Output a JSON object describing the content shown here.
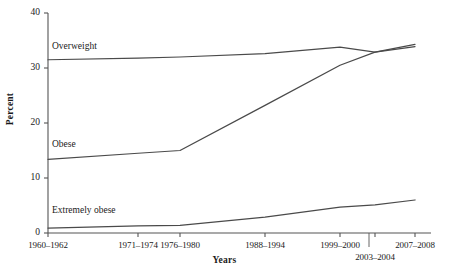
{
  "chart_data": {
    "type": "line",
    "title": "",
    "xlabel": "Years",
    "ylabel": "Percent",
    "ylim": [
      0,
      40
    ],
    "yticks": [
      0,
      10,
      20,
      30,
      40
    ],
    "ytick_labels": [
      "0",
      "10",
      "20",
      "30",
      "40"
    ],
    "grid": false,
    "legend_position": "inline-series-labels",
    "categories": [
      "1960–1962",
      "1971–1974",
      "1976–1980",
      "1988–1994",
      "1999–2000",
      "2003–2004",
      "2007–2008"
    ],
    "series": [
      {
        "name": "Overweight",
        "values": [
          31.5,
          31.8,
          32.0,
          32.6,
          33.8,
          32.9,
          34.3
        ],
        "color": "#4a4a4a"
      },
      {
        "name": "Obese",
        "values": [
          13.4,
          14.5,
          15.0,
          23.2,
          30.5,
          32.9,
          33.9
        ],
        "color": "#4a4a4a"
      },
      {
        "name": "Extremely obese",
        "values": [
          0.9,
          1.3,
          1.4,
          2.9,
          4.7,
          5.1,
          6.0
        ],
        "color": "#4a4a4a"
      }
    ],
    "annotations": [
      {
        "text": "Overweight",
        "series": "Overweight"
      },
      {
        "text": "Obese",
        "series": "Obese"
      },
      {
        "text": "Extremely obese",
        "series": "Extremely obese"
      }
    ],
    "axis_color": "#555555",
    "background_color": "#ffffff"
  },
  "axes": {
    "y_title": "Percent",
    "x_title": "Years",
    "y_ticks": [
      "40",
      "30",
      "20",
      "10",
      "0"
    ],
    "x_ticks_row1": [
      "1960–1962",
      "1971–1974",
      "1976–1980",
      "1988–1994",
      "1999–2000",
      "2007–2008"
    ],
    "x_ticks_row2": [
      "2003–2004"
    ]
  },
  "series_labels": {
    "overweight": "Overweight",
    "obese": "Obese",
    "extremely_obese": "Extremely obese"
  }
}
